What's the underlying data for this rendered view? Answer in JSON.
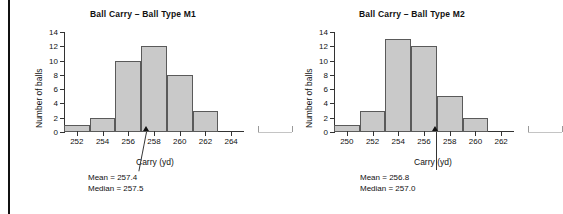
{
  "figure": {
    "axis_title_y": "Number of balls",
    "axis_title_x": "Carry (yd)",
    "mean_prefix": "Mean = ",
    "median_prefix": "Median = "
  },
  "chart_data": [
    {
      "type": "bar",
      "title": "Ball Carry – Ball Type M1",
      "xlabel": "Carry (yd)",
      "ylabel": "Number of balls",
      "categories": [
        "252",
        "254",
        "256",
        "258",
        "260",
        "262",
        "264"
      ],
      "values": [
        1,
        2,
        10,
        12,
        8,
        3,
        0
      ],
      "xticks": [
        "252",
        "254",
        "256",
        "258",
        "260",
        "262",
        "264"
      ],
      "yticks": [
        "0",
        "2",
        "4",
        "6",
        "8",
        "10",
        "12",
        "14"
      ],
      "ylim": [
        0,
        14
      ],
      "xlim": [
        251,
        265
      ],
      "bin_width": 2,
      "grid": false,
      "legend": "none",
      "annotations": {
        "mean_label": "Mean = 257.4",
        "median_label": "Median = 257.5",
        "mean": 257.4,
        "median": 257.5,
        "marker_value": 257.4
      }
    },
    {
      "type": "bar",
      "title": "Ball Carry – Ball Type M2",
      "xlabel": "Carry (yd)",
      "ylabel": "Number of balls",
      "categories": [
        "250",
        "252",
        "254",
        "256",
        "258",
        "260",
        "262"
      ],
      "values": [
        1,
        3,
        13,
        12,
        5,
        2,
        0
      ],
      "xticks": [
        "250",
        "252",
        "254",
        "256",
        "258",
        "260",
        "262"
      ],
      "yticks": [
        "0",
        "2",
        "4",
        "6",
        "8",
        "10",
        "12",
        "14"
      ],
      "ylim": [
        0,
        14
      ],
      "xlim": [
        249,
        263
      ],
      "bin_width": 2,
      "grid": false,
      "legend": "none",
      "annotations": {
        "mean_label": "Mean = 256.8",
        "median_label": "Median = 257.0",
        "mean": 256.8,
        "median": 257.0,
        "marker_value": 256.9
      }
    }
  ]
}
